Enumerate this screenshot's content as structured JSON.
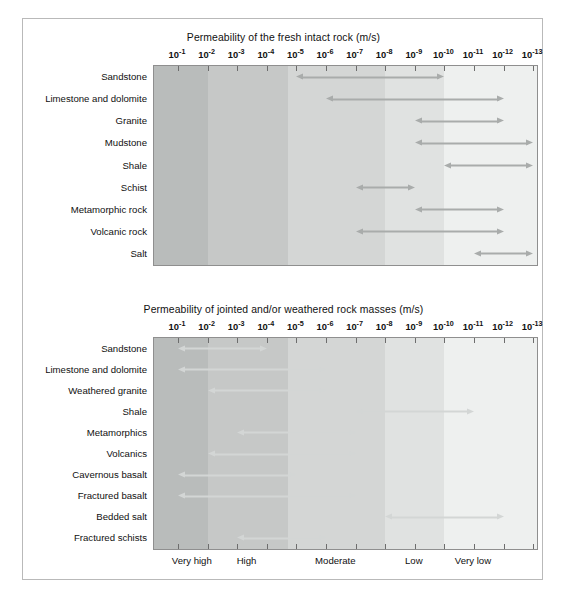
{
  "figure": {
    "axis_ticks": [
      "10⁻¹",
      "10⁻²",
      "10⁻³",
      "10⁻⁴",
      "10⁻⁵",
      "10⁻⁶",
      "10⁻⁷",
      "10⁻⁸",
      "10⁻⁹",
      "10⁻¹⁰",
      "10⁻¹¹",
      "10⁻¹²",
      "10⁻¹³"
    ],
    "tick_bases": [
      "10",
      "10",
      "10",
      "10",
      "10",
      "10",
      "10",
      "10",
      "10",
      "10",
      "10",
      "10",
      "10"
    ],
    "tick_exponents": [
      "-1",
      "-2",
      "-3",
      "-4",
      "-5",
      "-6",
      "-7",
      "-8",
      "-9",
      "-10",
      "-11",
      "-12",
      "-13"
    ],
    "class_labels": [
      "Very high",
      "High",
      "Moderate",
      "Low",
      "Very low"
    ],
    "band_colors": [
      "#b9bcbb",
      "#c6c8c7",
      "#d4d6d5",
      "#e0e2e1",
      "#eef0ef",
      "#fafbfa"
    ],
    "arrow_color_top": "#a9acab",
    "arrow_color_bottom": "#d3d6d5",
    "caption": ""
  },
  "chart_data": [
    {
      "type": "bar",
      "title": "Permeability of the fresh intact rock (m/s)",
      "xlabel": "",
      "ylabel": "",
      "xlim": [
        -1,
        -13
      ],
      "x_scale": "log10",
      "grid": false,
      "legend": "none",
      "tick_labels": [
        "10⁻¹",
        "10⁻²",
        "10⁻³",
        "10⁻⁴",
        "10⁻⁵",
        "10⁻⁶",
        "10⁻⁷",
        "10⁻⁸",
        "10⁻⁹",
        "10⁻¹⁰",
        "10⁻¹¹",
        "10⁻¹²",
        "10⁻¹³"
      ],
      "categories": [
        "Sandstone",
        "Limestone and dolomite",
        "Granite",
        "Mudstone",
        "Shale",
        "Schist",
        "Metamorphic rock",
        "Volcanic rock",
        "Salt"
      ],
      "ranges": [
        {
          "label": "Sandstone",
          "from": -5,
          "to": -10,
          "left_head": true,
          "right_head": true
        },
        {
          "label": "Limestone and dolomite",
          "from": -6,
          "to": -12,
          "left_head": true,
          "right_head": true
        },
        {
          "label": "Granite",
          "from": -9,
          "to": -12,
          "left_head": true,
          "right_head": true
        },
        {
          "label": "Mudstone",
          "from": -9,
          "to": -13,
          "left_head": true,
          "right_head": true
        },
        {
          "label": "Shale",
          "from": -10,
          "to": -13,
          "left_head": true,
          "right_head": true
        },
        {
          "label": "Schist",
          "from": -7,
          "to": -9,
          "left_head": true,
          "right_head": true
        },
        {
          "label": "Metamorphic rock",
          "from": -9,
          "to": -12,
          "left_head": true,
          "right_head": true
        },
        {
          "label": "Volcanic rock",
          "from": -7,
          "to": -12,
          "left_head": true,
          "right_head": true
        },
        {
          "label": "Salt",
          "from": -11,
          "to": -13,
          "left_head": true,
          "right_head": true
        }
      ]
    },
    {
      "type": "bar",
      "title": "Permeability of jointed and/or weathered rock masses (m/s)",
      "xlabel": "",
      "ylabel": "",
      "xlim": [
        -1,
        -13
      ],
      "x_scale": "log10",
      "grid": false,
      "legend": "none",
      "tick_labels": [
        "10⁻¹",
        "10⁻²",
        "10⁻³",
        "10⁻⁴",
        "10⁻⁵",
        "10⁻⁶",
        "10⁻⁷",
        "10⁻⁸",
        "10⁻⁹",
        "10⁻¹⁰",
        "10⁻¹¹",
        "10⁻¹²",
        "10⁻¹³"
      ],
      "categories": [
        "Sandstone",
        "Limestone and dolomite",
        "Weathered granite",
        "Shale",
        "Metamorphics",
        "Volcanics",
        "Cavernous basalt",
        "Fractured basalt",
        "Bedded salt",
        "Fractured schists"
      ],
      "ranges": [
        {
          "label": "Sandstone",
          "from": -1,
          "to": -4,
          "left_head": true,
          "right_head": true
        },
        {
          "label": "Limestone and dolomite",
          "from": -1,
          "to": -6,
          "left_head": true,
          "right_head": true
        },
        {
          "label": "Weathered granite",
          "from": -2,
          "to": -6,
          "left_head": true,
          "right_head": true
        },
        {
          "label": "Shale",
          "from": -7,
          "to": -11,
          "left_head": true,
          "right_head": true
        },
        {
          "label": "Metamorphics",
          "from": -3,
          "to": -7,
          "left_head": true,
          "right_head": true
        },
        {
          "label": "Volcanics",
          "from": -2,
          "to": -7,
          "left_head": true,
          "right_head": true
        },
        {
          "label": "Cavernous basalt",
          "from": -1,
          "to": -5,
          "left_head": true,
          "right_head": true
        },
        {
          "label": "Fractured basalt",
          "from": -1,
          "to": -7,
          "left_head": true,
          "right_head": true
        },
        {
          "label": "Bedded salt",
          "from": -8,
          "to": -12,
          "left_head": true,
          "right_head": true
        },
        {
          "label": "Fractured schists",
          "from": -3,
          "to": -6,
          "left_head": true,
          "right_head": true
        }
      ]
    }
  ]
}
